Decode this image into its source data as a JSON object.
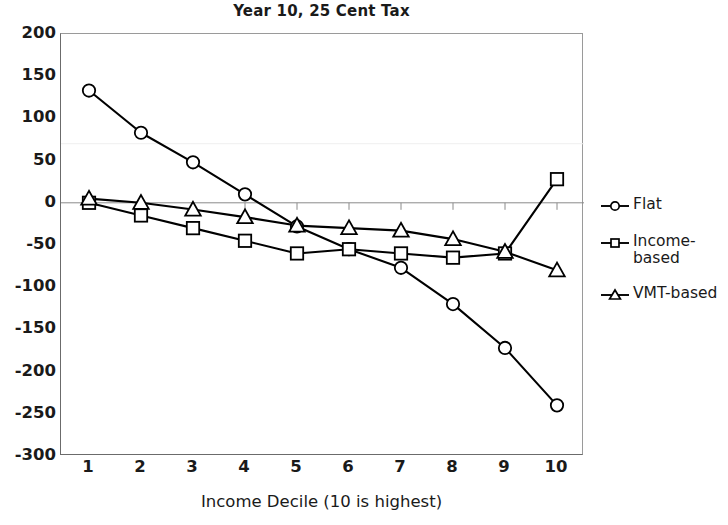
{
  "chart_data": {
    "type": "line",
    "title": "Year 10, 25 Cent Tax",
    "xlabel": "Income Decile (10 is highest)",
    "ylabel": "",
    "categories": [
      "1",
      "2",
      "3",
      "4",
      "5",
      "6",
      "7",
      "8",
      "9",
      "10"
    ],
    "xlim": [
      1,
      10
    ],
    "ylim": [
      -300,
      200
    ],
    "ytick_step": 50,
    "yticks": [
      200,
      150,
      100,
      50,
      0,
      -50,
      -100,
      -150,
      -200,
      -250,
      -300
    ],
    "ytick_labels": [
      "200",
      "150",
      "100",
      "50",
      "0",
      "-50",
      "-100",
      "-150",
      "-200",
      "-250",
      "-300"
    ],
    "grid": false,
    "zero_line": true,
    "legend_position": "right",
    "series": [
      {
        "name": "Flat",
        "marker": "circle",
        "color": "#000000",
        "values": [
          133,
          83,
          48,
          10,
          -28,
          -55,
          -77,
          -120,
          -172,
          -240
        ]
      },
      {
        "name": "Income-based",
        "marker": "square",
        "color": "#000000",
        "values": [
          0,
          -15,
          -30,
          -45,
          -60,
          -55,
          -60,
          -65,
          -60,
          28
        ]
      },
      {
        "name": "VMT-based",
        "marker": "triangle",
        "color": "#000000",
        "values": [
          5,
          0,
          -8,
          -17,
          -27,
          -30,
          -33,
          -43,
          -58,
          -80
        ]
      }
    ]
  },
  "legend": {
    "entries": [
      {
        "label": "Flat",
        "marker": "circle-marker"
      },
      {
        "label": "Income-\nbased",
        "marker": "square-marker"
      },
      {
        "label": "VMT-based",
        "marker": "triangle-marker"
      }
    ]
  },
  "colors": {
    "line": "#000000",
    "axis": "#6b6b6b",
    "frame": "#9a9a9a",
    "zero_line": "#8a8a8a",
    "text": "#1a1a1a",
    "background": "#ffffff"
  }
}
